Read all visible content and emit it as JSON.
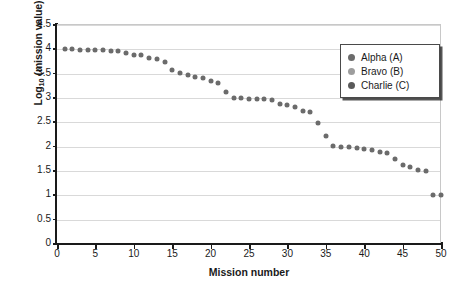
{
  "chart_data": {
    "type": "scatter",
    "title": "",
    "xlabel": "Mission number",
    "ylabel": "Log10 (mission value)",
    "ylabel_base": "Log",
    "ylabel_sub": "10",
    "ylabel_rest": " (mission value)",
    "xlim": [
      0,
      50
    ],
    "ylim": [
      0,
      4.5
    ],
    "xticks": [
      0,
      5,
      10,
      15,
      20,
      25,
      30,
      35,
      40,
      45,
      50
    ],
    "yticks": [
      0,
      0.5,
      1,
      1.5,
      2,
      2.5,
      3,
      3.5,
      4,
      4.5
    ],
    "xtick_labels": [
      "0",
      "5",
      "10",
      "15",
      "20",
      "25",
      "30",
      "35",
      "40",
      "45",
      "50"
    ],
    "ytick_labels": [
      "0",
      "0.5",
      "1",
      "1.5",
      "2",
      "2.5",
      "3",
      "3.5",
      "4",
      "4.5"
    ],
    "grid": "horizontal",
    "legend_position": "top-right",
    "marker_color": "#6b6b6b",
    "series": [
      {
        "name": "Alpha (A)",
        "label": "Alpha (A)",
        "color": "#6b6b6b",
        "x": [
          1,
          2,
          3,
          4,
          5,
          6,
          7,
          8,
          9,
          10,
          11,
          12,
          13,
          14,
          15,
          16,
          17,
          18,
          19,
          20,
          21,
          22,
          23,
          24,
          25,
          26,
          27,
          28,
          29,
          30,
          31,
          32,
          33,
          34,
          35,
          36,
          37,
          38,
          39,
          40,
          41,
          42,
          43,
          44,
          45,
          46,
          47,
          48,
          49,
          50
        ],
        "values": [
          4.0,
          4.0,
          3.99,
          3.99,
          3.99,
          3.98,
          3.97,
          3.96,
          3.93,
          3.89,
          3.88,
          3.83,
          3.81,
          3.74,
          3.57,
          3.52,
          3.47,
          3.44,
          3.41,
          3.34,
          3.31,
          3.13,
          3.01,
          3.01,
          2.98,
          2.98,
          2.97,
          2.95,
          2.88,
          2.86,
          2.82,
          2.73,
          2.72,
          2.48,
          2.22,
          2.02,
          2.0,
          1.99,
          1.98,
          1.96,
          1.94,
          1.89,
          1.87,
          1.75,
          1.63,
          1.59,
          1.52,
          1.51,
          1.0,
          1.0
        ]
      }
    ],
    "legend": [
      {
        "label": "Alpha (A)",
        "color": "#6b6b6b"
      },
      {
        "label": "Bravo (B)",
        "color": "#9d9d9d"
      },
      {
        "label": "Charlie (C)",
        "color": "#5a5a5a"
      }
    ]
  }
}
